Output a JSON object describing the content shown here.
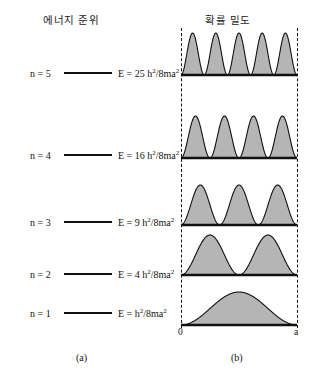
{
  "figure": {
    "panel_a": {
      "title": "에너지 준위",
      "caption": "(a)",
      "levels": [
        {
          "n_label": "n = 5",
          "energy_coeff": "25",
          "energy_prefix": "E = 25 h",
          "y": 73
        },
        {
          "n_label": "n = 4",
          "energy_coeff": "16",
          "energy_prefix": "E = 16 h",
          "y": 155
        },
        {
          "n_label": "n = 3",
          "energy_coeff": "9",
          "energy_prefix": "E = 9 h",
          "y": 222
        },
        {
          "n_label": "n = 2",
          "energy_coeff": "4",
          "energy_prefix": "E = 4 h",
          "y": 274
        },
        {
          "n_label": "n = 1",
          "energy_coeff": "",
          "energy_prefix": "E = h",
          "y": 313
        }
      ],
      "energy_sup_numerator": "2",
      "energy_denominator": "/8ma",
      "energy_sup_denominator": "2"
    },
    "panel_b": {
      "title": "확률 밀도",
      "caption": "(b)",
      "axis_left_label": "0",
      "axis_right_label": "a",
      "rows": [
        {
          "n": 5,
          "humps": 5,
          "baseline_y": 75,
          "amplitude": 42
        },
        {
          "n": 4,
          "humps": 4,
          "baseline_y": 158,
          "amplitude": 42
        },
        {
          "n": 3,
          "humps": 3,
          "baseline_y": 225,
          "amplitude": 40
        },
        {
          "n": 2,
          "humps": 2,
          "baseline_y": 275,
          "amplitude": 40
        },
        {
          "n": 1,
          "humps": 1,
          "baseline_y": 325,
          "amplitude": 33
        }
      ]
    }
  },
  "chart_data": {
    "type": "line",
    "panels": [
      {
        "id": "a",
        "type": "energy-level-diagram",
        "title": "에너지 준위",
        "caption": "(a)",
        "xlabel": "",
        "ylabel": "",
        "categories": [
          "n = 1",
          "n = 2",
          "n = 3",
          "n = 4",
          "n = 5"
        ],
        "values": [
          1,
          4,
          9,
          16,
          25
        ],
        "value_labels": [
          "E = h2/8ma2",
          "E = 4 h2/8ma2",
          "E = 9 h2/8ma2",
          "E = 16 h2/8ma2",
          "E = 25 h2/8ma2"
        ],
        "note": "Energy proportional to n^2 in units of h^2/8ma^2; lines drawn at equal visual spacing."
      },
      {
        "id": "b",
        "type": "area",
        "title": "확률 밀도",
        "caption": "(b)",
        "xlabel": "",
        "ylabel": "",
        "xlim": [
          0,
          1
        ],
        "xtick_labels": [
          "0",
          "a"
        ],
        "grid": false,
        "legend": "none",
        "series": [
          {
            "name": "n = 5",
            "humps": 5,
            "function": "sin^2(5*pi*x/a)"
          },
          {
            "name": "n = 4",
            "humps": 4,
            "function": "sin^2(4*pi*x/a)"
          },
          {
            "name": "n = 3",
            "humps": 3,
            "function": "sin^2(3*pi*x/a)"
          },
          {
            "name": "n = 2",
            "humps": 2,
            "function": "sin^2(2*pi*x/a)"
          },
          {
            "name": "n = 1",
            "humps": 1,
            "function": "sin^2(1*pi*x/a)"
          }
        ],
        "fill_color": "#b5b5b5",
        "line_color": "#1a1a1a"
      }
    ]
  },
  "colors": {
    "background": "#ffffff",
    "ink": "#111111",
    "fill": "#b5b5b5",
    "wall": "#111111"
  }
}
